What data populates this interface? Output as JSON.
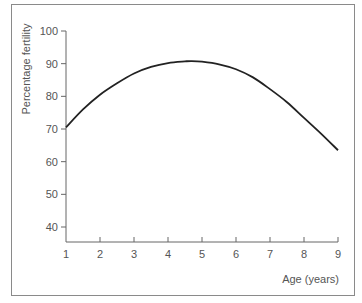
{
  "chart_data": {
    "type": "line",
    "title": "",
    "xlabel": "Age (years)",
    "ylabel": "Percentage fertility",
    "xlim": [
      1,
      9
    ],
    "ylim": [
      35,
      100
    ],
    "xticks": [
      1,
      2,
      3,
      4,
      5,
      6,
      7,
      8,
      9
    ],
    "yticks": [
      40,
      50,
      60,
      70,
      80,
      90,
      100
    ],
    "grid": false,
    "legend": null,
    "series": [
      {
        "name": "Percentage fertility",
        "color": "#222222",
        "x": [
          1,
          1.5,
          2,
          2.5,
          3,
          3.5,
          4,
          4.5,
          4.7,
          5,
          5.5,
          6,
          6.5,
          7,
          7.5,
          8,
          8.5,
          9
        ],
        "y": [
          70.5,
          76.0,
          80.5,
          84.0,
          87.0,
          89.0,
          90.2,
          90.7,
          90.8,
          90.6,
          89.8,
          88.3,
          85.8,
          82.2,
          78.2,
          73.4,
          68.6,
          63.5
        ]
      }
    ]
  },
  "labels": {
    "xlabel": "Age (years)",
    "ylabel": "Percentage fertility"
  }
}
